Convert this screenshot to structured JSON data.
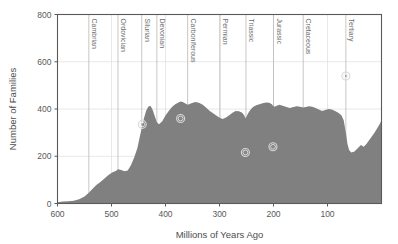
{
  "chart_data": {
    "type": "area",
    "title": "",
    "xlabel": "Millions of Years Ago",
    "ylabel": "Number of Families",
    "xlim": [
      600,
      0
    ],
    "ylim": [
      0,
      800
    ],
    "x_reversed": true,
    "grid": true,
    "legend": "none",
    "fill_color": "#808080",
    "background_color": "#ffffff",
    "xticks": [
      600,
      500,
      400,
      300,
      200,
      100
    ],
    "xtick_labels": [
      "600",
      "500",
      "400",
      "300",
      "200",
      "100"
    ],
    "yticks": [
      0,
      200,
      400,
      600,
      800
    ],
    "ytick_labels": [
      "0",
      "200",
      "400",
      "600",
      "800"
    ],
    "x": [
      600,
      590,
      580,
      570,
      560,
      550,
      542,
      535,
      528,
      520,
      512,
      505,
      498,
      492,
      488,
      482,
      476,
      470,
      464,
      458,
      452,
      448,
      444,
      440,
      436,
      432,
      428,
      424,
      420,
      416,
      412,
      406,
      400,
      394,
      388,
      382,
      376,
      372,
      368,
      364,
      359,
      352,
      345,
      338,
      331,
      324,
      318,
      312,
      306,
      299,
      294,
      288,
      282,
      276,
      270,
      264,
      258,
      254,
      252,
      250,
      247,
      243,
      238,
      232,
      226,
      220,
      214,
      208,
      203,
      201,
      198,
      194,
      189,
      183,
      176,
      170,
      163,
      157,
      151,
      145,
      140,
      134,
      128,
      122,
      116,
      110,
      104,
      98,
      92,
      86,
      80,
      74,
      70,
      66,
      63,
      60,
      56,
      50,
      44,
      38,
      33,
      28,
      23,
      18,
      13,
      8,
      3,
      0
    ],
    "y": [
      5,
      8,
      10,
      12,
      18,
      30,
      45,
      62,
      78,
      92,
      108,
      122,
      132,
      138,
      145,
      142,
      136,
      140,
      162,
      195,
      235,
      278,
      318,
      360,
      392,
      410,
      414,
      398,
      370,
      344,
      335,
      348,
      372,
      392,
      408,
      420,
      428,
      432,
      430,
      424,
      418,
      424,
      430,
      426,
      418,
      404,
      392,
      382,
      372,
      362,
      358,
      364,
      374,
      384,
      392,
      390,
      384,
      372,
      360,
      368,
      382,
      396,
      408,
      416,
      420,
      424,
      428,
      426,
      420,
      414,
      410,
      414,
      418,
      414,
      408,
      404,
      408,
      412,
      410,
      406,
      408,
      412,
      410,
      404,
      398,
      392,
      396,
      400,
      398,
      392,
      384,
      372,
      352,
      300,
      252,
      226,
      216,
      220,
      234,
      248,
      240,
      252,
      268,
      284,
      300,
      318,
      338,
      352
    ],
    "annotations": {
      "period_boundaries": [
        {
          "label": "Cambrian",
          "x": 542
        },
        {
          "label": "Ordovician",
          "x": 488
        },
        {
          "label": "Silurian",
          "x": 444
        },
        {
          "label": "Devonian",
          "x": 416
        },
        {
          "label": "Carboniferous",
          "x": 359
        },
        {
          "label": "Permian",
          "x": 299
        },
        {
          "label": "Triassic",
          "x": 251
        },
        {
          "label": "Jurassic",
          "x": 200
        },
        {
          "label": "Cretaceous",
          "x": 145
        },
        {
          "label": "Tertiary",
          "x": 66
        }
      ],
      "extinction_markers": [
        {
          "name": "end-Ordovician",
          "x": 443,
          "y": 335
        },
        {
          "name": "late-Devonian",
          "x": 372,
          "y": 360
        },
        {
          "name": "end-Permian",
          "x": 252,
          "y": 216
        },
        {
          "name": "end-Triassic",
          "x": 201,
          "y": 240
        },
        {
          "name": "end-Cretaceous",
          "x": 66,
          "y": 540
        }
      ]
    }
  }
}
